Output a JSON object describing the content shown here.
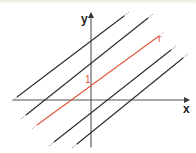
{
  "diagram": {
    "axes": {
      "x_label": "x",
      "y_label": "y",
      "origin_px": [
        91,
        100
      ]
    },
    "colors": {
      "axis": "#3a3a3a",
      "line": "#2a2a2a",
      "highlight": "#e0553a",
      "top_band": "#e8ecd6"
    },
    "lines": [
      {
        "id": "line-1",
        "from": [
          13,
          100
        ],
        "to": [
          128,
          13
        ],
        "highlight": false
      },
      {
        "id": "line-2",
        "from": [
          22,
          118
        ],
        "to": [
          152,
          15
        ],
        "highlight": false
      },
      {
        "id": "line-r",
        "from": [
          33,
          128
        ],
        "to": [
          163,
          33
        ],
        "highlight": true,
        "label": "r"
      },
      {
        "id": "line-4",
        "from": [
          50,
          145
        ],
        "to": [
          175,
          47
        ],
        "highlight": false
      },
      {
        "id": "line-5",
        "from": [
          73,
          147
        ],
        "to": [
          187,
          55
        ],
        "highlight": false
      }
    ],
    "intercept_label": "1"
  }
}
